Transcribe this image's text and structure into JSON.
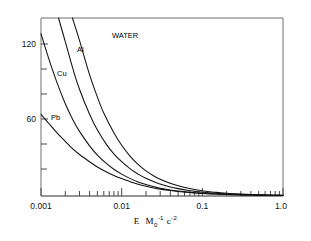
{
  "chart_data": {
    "type": "line",
    "title": "",
    "xlabel": "E M0^-1 c^-2",
    "xlabel_parts": {
      "e": "E",
      "m": "M",
      "m_sub": "0",
      "m_sup": "-1",
      "c": "c",
      "c_sup": "-2"
    },
    "ylabel": "",
    "xscale": "log",
    "yscale": "linear",
    "xlim": [
      0.001,
      1.0
    ],
    "ylim": [
      0,
      135
    ],
    "grid": false,
    "legend": "inline-curve-labels",
    "xticks_major": [
      0.001,
      0.01,
      0.1,
      1.0
    ],
    "xticklabels": [
      "0.001",
      "0.01",
      "0.1",
      "1.0"
    ],
    "yticks_major": [
      60,
      120
    ],
    "yticklabels": [
      "60",
      "120"
    ],
    "yticks_minor": [
      20,
      40,
      80,
      100
    ],
    "series": [
      {
        "name": "WATER",
        "label": "WATER",
        "color": "#111111",
        "x": [
          0.00245,
          0.003,
          0.004,
          0.005,
          0.006,
          0.008,
          0.01,
          0.013,
          0.016,
          0.02,
          0.026,
          0.03,
          0.04,
          0.05,
          0.065,
          0.08,
          0.1,
          0.13,
          0.16,
          0.2,
          0.26,
          0.3,
          0.4,
          0.5,
          0.65,
          0.8,
          1.0
        ],
        "y": [
          135,
          118,
          92,
          75,
          63,
          48,
          38.5,
          29.5,
          24.0,
          19.0,
          14.6,
          12.7,
          9.6,
          7.7,
          6.0,
          4.9,
          4.0,
          3.1,
          2.6,
          2.1,
          1.7,
          1.5,
          1.2,
          1.0,
          0.8,
          0.7,
          0.6
        ]
      },
      {
        "name": "Al",
        "label": "Al",
        "color": "#111111",
        "x": [
          0.00165,
          0.002,
          0.0025,
          0.003,
          0.004,
          0.005,
          0.0065,
          0.008,
          0.01,
          0.013,
          0.016,
          0.02,
          0.026,
          0.03,
          0.04,
          0.05,
          0.065,
          0.08,
          0.1,
          0.13,
          0.16,
          0.2,
          0.26,
          0.3,
          0.4,
          0.5,
          0.65,
          0.8,
          1.0
        ],
        "y": [
          135,
          117,
          96,
          81,
          62,
          50,
          39,
          32,
          26,
          20.2,
          16.6,
          13.4,
          10.4,
          9.1,
          6.9,
          5.6,
          4.4,
          3.6,
          2.9,
          2.3,
          1.9,
          1.55,
          1.25,
          1.1,
          0.9,
          0.75,
          0.6,
          0.5,
          0.45
        ]
      },
      {
        "name": "Cu",
        "label": "Cu",
        "color": "#111111",
        "x": [
          0.001,
          0.00125,
          0.0016,
          0.002,
          0.0025,
          0.003,
          0.004,
          0.005,
          0.0065,
          0.008,
          0.01,
          0.013,
          0.016,
          0.02,
          0.026,
          0.03,
          0.04,
          0.05,
          0.065,
          0.08,
          0.1,
          0.13,
          0.16,
          0.2,
          0.26,
          0.3,
          0.4,
          0.5,
          0.65,
          0.8,
          1.0
        ],
        "y": [
          123,
          104,
          85,
          70,
          57.5,
          49,
          38,
          31,
          24.5,
          20.3,
          16.6,
          13.0,
          10.7,
          8.7,
          6.8,
          5.9,
          4.6,
          3.8,
          3.0,
          2.5,
          2.05,
          1.65,
          1.4,
          1.15,
          0.95,
          0.85,
          0.7,
          0.6,
          0.5,
          0.42,
          0.35
        ]
      },
      {
        "name": "Pb",
        "label": "Pb",
        "color": "#111111",
        "x": [
          0.001,
          0.00125,
          0.0016,
          0.002,
          0.0025,
          0.003,
          0.004,
          0.005,
          0.0065,
          0.008,
          0.01,
          0.013,
          0.016,
          0.02,
          0.026,
          0.03,
          0.04,
          0.05,
          0.065,
          0.08,
          0.1,
          0.13,
          0.16,
          0.2,
          0.26,
          0.3,
          0.4,
          0.5,
          0.65,
          0.8,
          1.0
        ],
        "y": [
          62,
          55,
          47.5,
          41.5,
          35.5,
          31.5,
          26,
          22,
          18.2,
          15.6,
          13.2,
          10.6,
          8.9,
          7.4,
          5.9,
          5.2,
          4.1,
          3.4,
          2.8,
          2.35,
          1.95,
          1.6,
          1.35,
          1.15,
          0.95,
          0.85,
          0.7,
          0.6,
          0.5,
          0.42,
          0.35
        ]
      }
    ],
    "curve_label_positions": [
      {
        "name": "WATER",
        "x_px": 112,
        "y_px": 38
      },
      {
        "name": "Al",
        "x_px": 77,
        "y_px": 52
      },
      {
        "name": "Cu",
        "x_px": 57,
        "y_px": 76
      },
      {
        "name": "Pb",
        "x_px": 51,
        "y_px": 120
      }
    ]
  }
}
